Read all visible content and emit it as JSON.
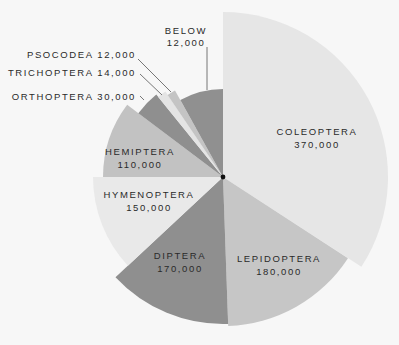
{
  "chart_data": {
    "type": "pie",
    "subtype": "polar-area (variable radius wedges)",
    "title": "",
    "center": [
      223,
      177
    ],
    "series": [
      {
        "name": "COLEOPTERA",
        "value": 370000,
        "label": "370,000",
        "start_deg": 0,
        "end_deg": 123,
        "radius": 165,
        "color": "#e6e6e6"
      },
      {
        "name": "LEPIDOPTERA",
        "value": 180000,
        "label": "180,000",
        "start_deg": 123,
        "end_deg": 178,
        "radius": 149,
        "color": "#c6c6c6"
      },
      {
        "name": "DIPTERA",
        "value": 170000,
        "label": "170,000",
        "start_deg": 178,
        "end_deg": 227,
        "radius": 147,
        "color": "#8f8f8f"
      },
      {
        "name": "HYMENOPTERA",
        "value": 150000,
        "label": "150,000",
        "start_deg": 227,
        "end_deg": 270,
        "radius": 130,
        "color": "#e9e9e9"
      },
      {
        "name": "HEMIPTERA",
        "value": 110000,
        "label": "110,000",
        "start_deg": 270,
        "end_deg": 307,
        "radius": 120,
        "color": "#c2c2c2"
      },
      {
        "name": "ORTHOPTERA",
        "value": 30000,
        "label": "30,000",
        "start_deg": 307,
        "end_deg": 321,
        "radius": 106,
        "color": "#8f8f8f"
      },
      {
        "name": "TRICHOPTERA",
        "value": 14000,
        "label": "14,000",
        "start_deg": 321,
        "end_deg": 326,
        "radius": 103,
        "color": "#e4e4e4"
      },
      {
        "name": "PSOCODEA",
        "value": 12000,
        "label": "12,000",
        "start_deg": 326,
        "end_deg": 331,
        "radius": 99,
        "color": "#c4c4c4"
      },
      {
        "name": "BELOW",
        "value": 12000,
        "label": "12,000",
        "start_deg": 331,
        "end_deg": 360,
        "radius": 88,
        "color": "#909090"
      }
    ],
    "legend": "none (direct labels)"
  },
  "labels": {
    "coleoptera": {
      "name": "COLEOPTERA",
      "value": "370,000"
    },
    "lepidoptera": {
      "name": "LEPIDOPTERA",
      "value": "180,000"
    },
    "diptera": {
      "name": "DIPTERA",
      "value": "170,000"
    },
    "hymenoptera": {
      "name": "HYMENOPTERA",
      "value": "150,000"
    },
    "hemiptera": {
      "name": "HEMIPTERA",
      "value": "110,000"
    },
    "orthoptera": "ORTHOPTERA 30,000",
    "trichoptera": "TRICHOPTERA 14,000",
    "psocodea": "PSOCODEA 12,000",
    "below": {
      "name": "BELOW",
      "value": "12,000"
    }
  },
  "colors": {
    "background": "#f7f7f7",
    "text": "#2a2a2a",
    "leader": "#555555",
    "center_dot": "#111111"
  }
}
